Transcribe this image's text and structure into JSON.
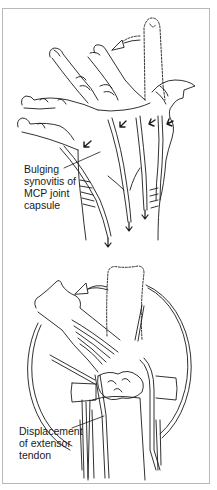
{
  "figure": {
    "panels": [
      {
        "id": "top",
        "subject": "hand-dorsal-view-ulnar-deviation",
        "label": {
          "lines": [
            "Bulging",
            "synovitis of",
            "MCP joint",
            "capsule"
          ]
        },
        "arrows": [
          "curved-deviation-arrow",
          "tendon-displacement-arrows",
          "downward-tendon-arrows"
        ]
      },
      {
        "id": "bottom",
        "subject": "mcp-joint-magnified-view",
        "label": {
          "lines": [
            "Displacement",
            "of extensor",
            "tendon"
          ]
        },
        "arrows": [
          "curved-deviation-arrow"
        ]
      }
    ],
    "colors": {
      "line": "#1a1a1a",
      "frame": "#b8b8b8",
      "background": "#ffffff"
    }
  }
}
